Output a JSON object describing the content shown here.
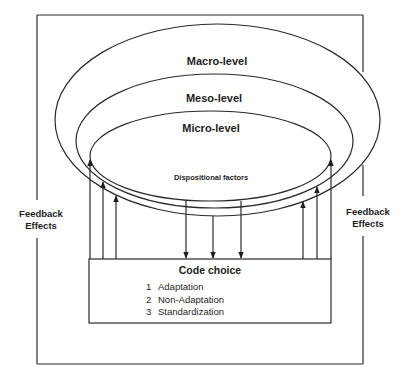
{
  "levels": {
    "macro": "Macro-level",
    "meso": "Meso-level",
    "micro": "Micro-level"
  },
  "inner_label": "Dispositional factors",
  "feedback": {
    "left": {
      "line1": "Feedback",
      "line2": "Effects"
    },
    "right": {
      "line1": "Feedback",
      "line2": "Effects"
    }
  },
  "code_choice": {
    "title": "Code choice",
    "items": [
      {
        "num": "1",
        "label": "Adaptation"
      },
      {
        "num": "2",
        "label": "Non-Adaptation"
      },
      {
        "num": "3",
        "label": "Standardization"
      }
    ]
  },
  "colors": {
    "line": "#2a2a2a",
    "text": "#1e1e1e",
    "background": "#ffffff"
  }
}
